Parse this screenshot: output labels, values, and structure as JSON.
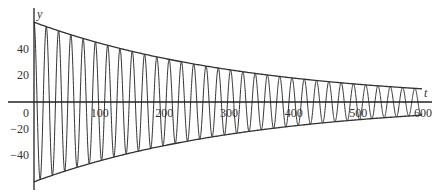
{
  "chart_data": {
    "type": "line",
    "title": "",
    "xlabel": "t",
    "ylabel": "y",
    "xlim": [
      0,
      600
    ],
    "ylim": [
      -60,
      60
    ],
    "xticks": [
      0,
      100,
      200,
      300,
      400,
      500,
      600
    ],
    "yticks": [
      -40,
      -20,
      20,
      40
    ],
    "grid": false,
    "legend": null,
    "series": [
      {
        "name": "damped oscillation",
        "description": "y = 60 e^{-0.003 t} cos(2πt/19)",
        "amplitude0": 60,
        "decay_rate": 0.003,
        "period": 19,
        "t_range": [
          0,
          600
        ]
      },
      {
        "name": "upper envelope",
        "description": "y = 60 e^{-0.003 t}",
        "x": [
          0,
          100,
          200,
          300,
          400,
          500,
          600
        ],
        "values": [
          60,
          44.4,
          32.9,
          24.4,
          18.1,
          13.4,
          9.9
        ]
      },
      {
        "name": "lower envelope",
        "description": "y = -60 e^{-0.003 t}",
        "x": [
          0,
          100,
          200,
          300,
          400,
          500,
          600
        ],
        "values": [
          -60,
          -44.4,
          -32.9,
          -24.4,
          -18.1,
          -13.4,
          -9.9
        ]
      }
    ]
  },
  "axis": {
    "x_label": "t",
    "y_label": "y",
    "x_tick_labels": [
      "0",
      "100",
      "200",
      "300",
      "400",
      "500",
      "600"
    ],
    "y_tick_labels": [
      "40",
      "20",
      "-20",
      "-40"
    ]
  }
}
